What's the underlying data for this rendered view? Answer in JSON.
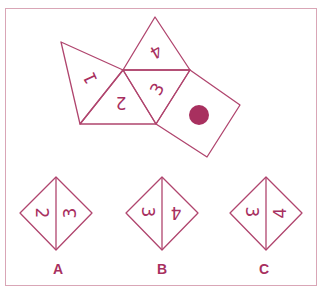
{
  "diagram": {
    "type": "cube-net-puzzle",
    "accent_color": "#a8305f",
    "net": {
      "faces": [
        {
          "id": "face-1",
          "label": "1",
          "shape": "triangle"
        },
        {
          "id": "face-2",
          "label": "2",
          "shape": "triangle"
        },
        {
          "id": "face-3",
          "label": "3",
          "shape": "triangle"
        },
        {
          "id": "face-4",
          "label": "4",
          "shape": "triangle"
        },
        {
          "id": "face-dot",
          "label": "",
          "shape": "square",
          "mark": "filled-circle"
        }
      ]
    },
    "options": [
      {
        "letter": "A",
        "left": "2",
        "right": "3"
      },
      {
        "letter": "B",
        "left": "3",
        "right": "4"
      },
      {
        "letter": "C",
        "left": "3",
        "right": "4"
      }
    ]
  }
}
